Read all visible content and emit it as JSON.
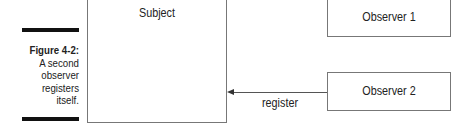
{
  "figure": {
    "number_label": "Figure 4-2:",
    "caption_lines": [
      "A second",
      "observer",
      "registers",
      "itself."
    ]
  },
  "diagram": {
    "nodes": [
      {
        "id": "subject",
        "label": "Subject"
      },
      {
        "id": "observer1",
        "label": "Observer 1"
      },
      {
        "id": "observer2",
        "label": "Observer 2"
      }
    ],
    "edges": [
      {
        "from": "observer2",
        "to": "subject",
        "label": "register"
      }
    ]
  }
}
